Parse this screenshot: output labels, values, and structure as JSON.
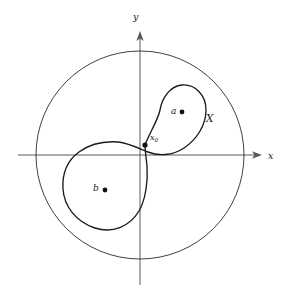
{
  "figure": {
    "kind": "math-diagram",
    "canvas": {
      "width": 285,
      "height": 298,
      "background": "#ffffff"
    },
    "colors": {
      "axis": "#5a5a5a",
      "circle": "#2a2a2a",
      "curve": "#1a1a1a",
      "dot": "#111111",
      "label": "#1a1a1a"
    },
    "axes": {
      "origin": {
        "x": 140,
        "y": 155
      },
      "x_axis": {
        "label": "x",
        "label_pos": {
          "x": 269,
          "y": 151
        },
        "start": {
          "x": 18,
          "y": 155
        },
        "end": {
          "x": 262,
          "y": 155
        },
        "arrow": "right"
      },
      "y_axis": {
        "label": "y",
        "label_pos": {
          "x": 134,
          "y": 15
        },
        "start": {
          "x": 140,
          "y": 285
        },
        "end": {
          "x": 140,
          "y": 31
        },
        "arrow": "up"
      }
    },
    "outer_circle": {
      "name": "ambient-disc",
      "center": {
        "x": 140,
        "y": 155
      },
      "radius": 104
    },
    "curve": {
      "name": "figure-eight",
      "label": "X",
      "label_pos": {
        "x": 207,
        "y": 113
      },
      "basepoint_label": "x₀",
      "basepoint_label_base": "x",
      "basepoint_label_sub": "0",
      "basepoint_label_pos": {
        "x": 150,
        "y": 134
      },
      "basepoint": {
        "x": 145,
        "y": 145
      },
      "upper_lobe": {
        "top": 85,
        "left": 153,
        "right": 206,
        "bottom": 152
      },
      "lower_lobe": {
        "top": 150,
        "left": 62,
        "right": 148,
        "bottom": 229
      }
    },
    "points": [
      {
        "id": "a",
        "label": "a",
        "label_pos": {
          "x": 171,
          "y": 107
        },
        "dot_pos": {
          "x": 182,
          "y": 112
        },
        "dot_radius": 2.4
      },
      {
        "id": "b",
        "label": "b",
        "label_pos": {
          "x": 93,
          "y": 184
        },
        "dot_pos": {
          "x": 105,
          "y": 190
        },
        "dot_radius": 2.4
      },
      {
        "id": "x0",
        "label": "x₀",
        "dot_pos": {
          "x": 145,
          "y": 145
        },
        "dot_radius": 2.6
      }
    ]
  }
}
